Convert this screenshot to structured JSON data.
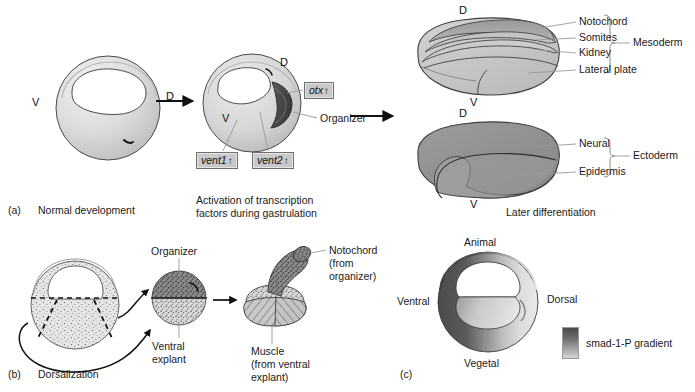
{
  "figure": {
    "colors": {
      "light_gray": "#d9d9d9",
      "mid_gray": "#b6b6b6",
      "dark_gray": "#8d8d8d",
      "organizer_dark": "#4f4f4f",
      "outline": "#3a3a3a",
      "leader_line": "#8a8a8a"
    }
  },
  "panel_a": {
    "id": "(a)",
    "caption": "Normal development",
    "caption2_line1": "Activation of transcription",
    "caption2_line2": "factors during gastrulation",
    "caption3": "Later differentiation",
    "embryo1": {
      "ventral_label": "V",
      "dorsal_label": "D"
    },
    "embryo2": {
      "ventral_label": "V",
      "dorsal_label": "D",
      "organizer_label": "Organizer"
    },
    "gene_boxes": [
      {
        "name": "otx",
        "arrow": "↑"
      },
      {
        "name": "vent1",
        "arrow": "↑"
      },
      {
        "name": "vent2",
        "arrow": "↑"
      }
    ],
    "mesoderm_embryo": {
      "dorsal_label": "D",
      "ventral_label": "V",
      "group_label": "Mesoderm",
      "tissues": [
        "Notochord",
        "Somites",
        "Kidney",
        "Lateral plate"
      ]
    },
    "ectoderm_embryo": {
      "dorsal_label": "D",
      "ventral_label": "V",
      "group_label": "Ectoderm",
      "tissues": [
        "Neural",
        "Epidermis"
      ]
    }
  },
  "panel_b": {
    "id": "(b)",
    "caption": "Dorsalization",
    "organizer_label": "Organizer",
    "ventral_explant_line1": "Ventral",
    "ventral_explant_line2": "explant",
    "notochord_line1": "Notochord",
    "notochord_line2": "(from",
    "notochord_line3": "organizer)",
    "muscle_line1": "Muscle",
    "muscle_line2": "(from ventral",
    "muscle_line3": "explant)"
  },
  "panel_c": {
    "id": "(c)",
    "animal_label": "Animal",
    "vegetal_label": "Vegetal",
    "ventral_label": "Ventral",
    "dorsal_label": "Dorsal",
    "legend_label": "smad-1-P gradient"
  }
}
